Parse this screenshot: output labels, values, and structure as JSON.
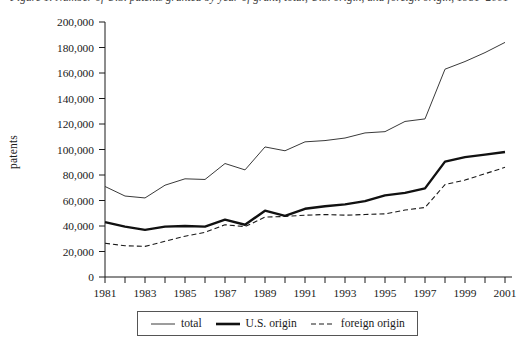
{
  "figure": {
    "caption": "Figure 1. Number of U.S. patents granted by year of grant, total, U.S. origin, and foreign origin, 1981–2001"
  },
  "axes": {
    "y_title": "patents",
    "y_ticks": [
      "200,000",
      "180,000",
      "160,000",
      "140,000",
      "120,000",
      "100,000",
      "80,000",
      "60,000",
      "40,000",
      "20,000",
      "0"
    ],
    "x_ticks": [
      "1981",
      "1983",
      "1985",
      "1987",
      "1989",
      "1991",
      "1993",
      "1995",
      "1997",
      "1999",
      "2001"
    ]
  },
  "legend": {
    "position": "bottom-center",
    "items": [
      {
        "label": "total",
        "style": "thin-solid",
        "color": "#3a3a3a"
      },
      {
        "label": "U.S. origin",
        "style": "thick-solid",
        "color": "#111111"
      },
      {
        "label": "foreign origin",
        "style": "dashed",
        "color": "#1a1a1a"
      }
    ]
  },
  "chart_data": {
    "type": "line",
    "xlabel": "",
    "ylabel": "patents",
    "x": [
      1981,
      1982,
      1983,
      1984,
      1985,
      1986,
      1987,
      1988,
      1989,
      1990,
      1991,
      1992,
      1993,
      1994,
      1995,
      1996,
      1997,
      1998,
      1999,
      2000,
      2001
    ],
    "xlim": [
      1981,
      2001
    ],
    "ylim": [
      0,
      200000
    ],
    "ytick_interval": 20000,
    "xtick_interval": 2,
    "grid": false,
    "series": [
      {
        "name": "total",
        "style": "thin-solid",
        "values": [
          71000,
          63500,
          62000,
          72000,
          77000,
          76500,
          89000,
          84000,
          102000,
          99000,
          106000,
          107000,
          109000,
          113000,
          114000,
          122000,
          124000,
          163000,
          169000,
          176000,
          184000
        ]
      },
      {
        "name": "U.S. origin",
        "style": "thick-solid",
        "values": [
          43000,
          39500,
          37000,
          39500,
          40000,
          39500,
          45000,
          41000,
          52000,
          48000,
          53500,
          55500,
          57000,
          59500,
          64000,
          66000,
          69500,
          90500,
          94000,
          96000,
          98000
        ]
      },
      {
        "name": "foreign origin",
        "style": "dashed",
        "values": [
          26500,
          24500,
          24000,
          28000,
          32000,
          35000,
          41000,
          39500,
          47000,
          47500,
          48500,
          49000,
          48500,
          49000,
          49500,
          52500,
          54500,
          72500,
          76000,
          81000,
          86000
        ]
      }
    ]
  }
}
